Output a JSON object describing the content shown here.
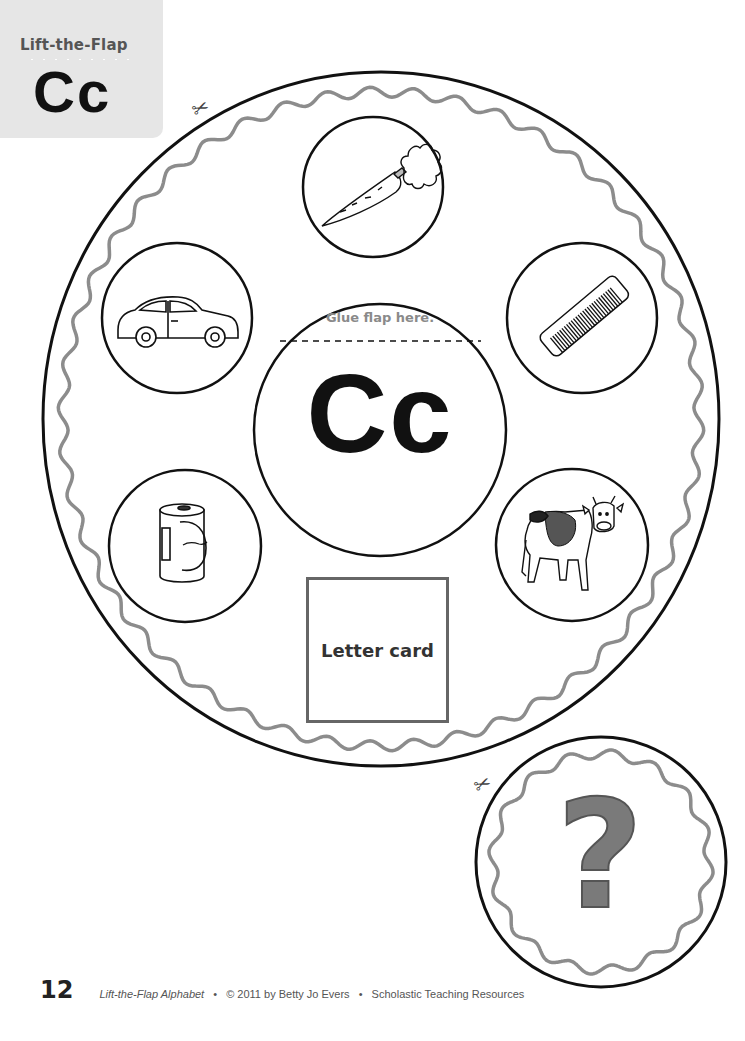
{
  "header": {
    "series_title": "Lift-the-Flap",
    "letter": "Cc"
  },
  "wheel": {
    "center_flap": {
      "glue_instruction": "Glue flap here.",
      "letter": "Cc"
    },
    "pictures": [
      {
        "position": "top",
        "label": "carrot",
        "icon": "carrot-icon"
      },
      {
        "position": "upper-left",
        "label": "car",
        "icon": "car-icon"
      },
      {
        "position": "upper-right",
        "label": "comb",
        "icon": "comb-icon"
      },
      {
        "position": "lower-left",
        "label": "can",
        "icon": "can-icon"
      },
      {
        "position": "lower-right",
        "label": "cow",
        "icon": "cow-icon"
      }
    ],
    "letter_card_label": "Letter card",
    "cut_icon": "scissors-icon"
  },
  "cover_flap": {
    "symbol": "?",
    "cut_icon": "scissors-icon"
  },
  "footer": {
    "page_number": "12",
    "book_title": "Lift-the-Flap Alphabet",
    "separator": "•",
    "copyright": "© 2011 by Betty Jo Evers",
    "publisher": "Scholastic Teaching Resources"
  },
  "colors": {
    "header_bg": "#e6e6e6",
    "outline": "#111111",
    "wavy_border": "#8c8c8c",
    "glue_text": "#8a8a8a",
    "question_mark": "#7a7a7a"
  }
}
